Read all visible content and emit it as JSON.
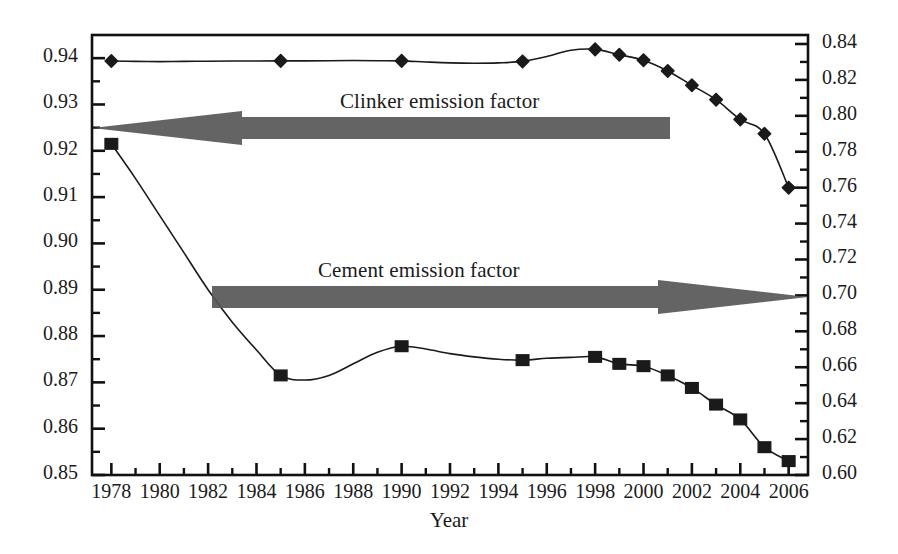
{
  "chart_data": {
    "type": "line",
    "title": "",
    "xlabel": "Year",
    "ylabel": "",
    "grid": false,
    "legend_position": "inline-annotations",
    "x": [
      1978,
      1979,
      1980,
      1981,
      1982,
      1983,
      1984,
      1985,
      1986,
      1987,
      1988,
      1989,
      1990,
      1991,
      1992,
      1993,
      1994,
      1995,
      1996,
      1997,
      1998,
      1999,
      2000,
      2001,
      2002,
      2003,
      2004,
      2005,
      2006
    ],
    "xlim": [
      1977.2,
      2006.8
    ],
    "xticks": [
      1978,
      1980,
      1982,
      1984,
      1986,
      1988,
      1990,
      1992,
      1994,
      1996,
      1998,
      2000,
      2002,
      2004,
      2006
    ],
    "xtick_labels": [
      "1978",
      "1980",
      "1982",
      "1984",
      "1986",
      "1988",
      "1990",
      "1992",
      "1994",
      "1996",
      "1998",
      "2000",
      "2002",
      "2004",
      "2006"
    ],
    "xtick_minor_step": 1,
    "left_axis": {
      "label": "",
      "ylim": [
        0.85,
        0.945
      ],
      "ticks": [
        0.85,
        0.86,
        0.87,
        0.88,
        0.89,
        0.9,
        0.91,
        0.92,
        0.93,
        0.94
      ],
      "tick_labels": [
        "0.85",
        "0.86",
        "0.87",
        "0.88",
        "0.89",
        "0.90",
        "0.91",
        "0.92",
        "0.93",
        "0.94"
      ],
      "minor_step": 0.005
    },
    "right_axis": {
      "label": "",
      "ylim": [
        0.6,
        0.845
      ],
      "ticks": [
        0.6,
        0.62,
        0.64,
        0.66,
        0.68,
        0.7,
        0.72,
        0.74,
        0.76,
        0.78,
        0.8,
        0.82,
        0.84
      ],
      "tick_labels": [
        "0.60",
        "0.62",
        "0.64",
        "0.66",
        "0.68",
        "0.70",
        "0.72",
        "0.74",
        "0.76",
        "0.78",
        "0.80",
        "0.82",
        "0.84"
      ],
      "minor_step": 0.01
    },
    "series": [
      {
        "name": "Clinker emission factor",
        "axis": "right",
        "marker": "diamond",
        "color": "#1a1a1a",
        "annotation": "Clinker emission factor",
        "arrow_direction": "left",
        "values": [
          0.8305,
          0.8303,
          0.8302,
          0.8303,
          0.8304,
          0.8305,
          0.8305,
          0.8306,
          0.8306,
          0.8307,
          0.8308,
          0.8307,
          0.8306,
          0.83,
          0.8295,
          0.8293,
          0.8295,
          0.8303,
          0.833,
          0.8365,
          0.837,
          0.834,
          0.831,
          0.825,
          0.817,
          0.809,
          0.798,
          0.79,
          0.76
        ],
        "marker_years": [
          1978,
          1985,
          1990,
          1995,
          1998,
          1999,
          2000,
          2001,
          2002,
          2003,
          2004,
          2005,
          2006
        ],
        "marker_values": [
          0.8305,
          0.8306,
          0.8306,
          0.8303,
          0.837,
          0.834,
          0.831,
          0.825,
          0.817,
          0.809,
          0.798,
          0.79,
          0.76
        ]
      },
      {
        "name": "Cement emission factor",
        "axis": "left",
        "marker": "square",
        "color": "#1a1a1a",
        "annotation": "Cement emission factor",
        "arrow_direction": "right",
        "values": [
          0.9215,
          0.914,
          0.906,
          0.898,
          0.89,
          0.883,
          0.877,
          0.8715,
          0.8705,
          0.8715,
          0.874,
          0.8765,
          0.8778,
          0.8772,
          0.8762,
          0.8755,
          0.875,
          0.8748,
          0.8752,
          0.8754,
          0.8755,
          0.874,
          0.8735,
          0.8715,
          0.8688,
          0.8652,
          0.862,
          0.856,
          0.853
        ],
        "marker_years": [
          1978,
          1985,
          1990,
          1995,
          1998,
          1999,
          2000,
          2001,
          2002,
          2003,
          2004,
          2005,
          2006
        ],
        "marker_values": [
          0.9215,
          0.8715,
          0.8778,
          0.8748,
          0.8755,
          0.874,
          0.8735,
          0.8715,
          0.8688,
          0.8652,
          0.862,
          0.856,
          0.853
        ]
      }
    ],
    "annotations": [
      {
        "text": "Clinker emission factor",
        "x": 1992.0,
        "axis": "right"
      },
      {
        "text": "Cement emission factor",
        "x": 1991.0,
        "axis": "left"
      }
    ]
  },
  "axes": {
    "x_title": "Year"
  },
  "colors": {
    "line": "#1a1a1a",
    "arrow": "#575757",
    "frame": "#111111",
    "background": "#ffffff"
  }
}
